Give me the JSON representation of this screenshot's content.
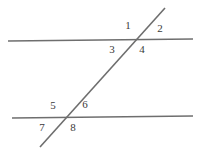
{
  "figure": {
    "width": 206,
    "height": 153,
    "background_color": "#ffffff",
    "line_color": "#6e6e6e",
    "label_color": "#3a3a3a",
    "line_width": 1.6,
    "lines": [
      {
        "name": "upper-parallel-line",
        "x1": 8,
        "y1": 41,
        "x2": 193,
        "y2": 39
      },
      {
        "name": "lower-parallel-line",
        "x1": 12,
        "y1": 118,
        "x2": 193,
        "y2": 116
      },
      {
        "name": "transversal-line",
        "x1": 165,
        "y1": 8,
        "x2": 40,
        "y2": 147
      }
    ],
    "intersections": [
      {
        "name": "upper-intersection",
        "x": 133,
        "y": 40
      },
      {
        "name": "lower-intersection",
        "x": 68,
        "y": 117
      }
    ],
    "labels": [
      {
        "text": "1",
        "x": 128,
        "y": 25,
        "position": "upper-left",
        "vertex": "upper-intersection"
      },
      {
        "text": "2",
        "x": 160,
        "y": 28,
        "position": "upper-right",
        "vertex": "upper-intersection"
      },
      {
        "text": "3",
        "x": 112,
        "y": 49,
        "position": "lower-left",
        "vertex": "upper-intersection"
      },
      {
        "text": "4",
        "x": 142,
        "y": 49,
        "position": "lower-right",
        "vertex": "upper-intersection"
      },
      {
        "text": "5",
        "x": 53,
        "y": 105,
        "position": "upper-left",
        "vertex": "lower-intersection"
      },
      {
        "text": "6",
        "x": 85,
        "y": 104,
        "position": "upper-right",
        "vertex": "lower-intersection"
      },
      {
        "text": "7",
        "x": 42,
        "y": 127,
        "position": "lower-left",
        "vertex": "lower-intersection"
      },
      {
        "text": "8",
        "x": 73,
        "y": 127,
        "position": "lower-right",
        "vertex": "lower-intersection"
      }
    ]
  }
}
